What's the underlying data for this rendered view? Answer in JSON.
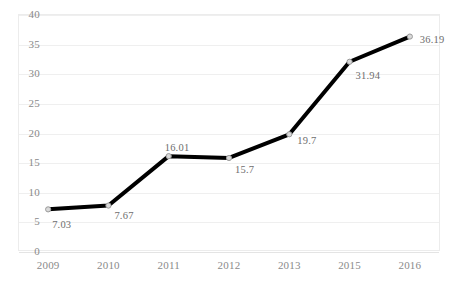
{
  "chart_data": {
    "type": "line",
    "title": "",
    "subtitle": "",
    "xlabel": "",
    "ylabel": "",
    "categories": [
      "2009",
      "2010",
      "2011",
      "2012",
      "2013",
      "2015",
      "2016"
    ],
    "values": [
      7.03,
      7.67,
      16.01,
      15.7,
      19.7,
      31.94,
      36.19
    ],
    "data_labels": [
      "7.03",
      "7.67",
      "16.01",
      "15.7",
      "19.7",
      "31.94",
      "36.19"
    ],
    "series": [
      {
        "name": "",
        "values": [
          7.03,
          7.67,
          16.01,
          15.7,
          19.7,
          31.94,
          36.19
        ]
      }
    ],
    "ylim": [
      0,
      40
    ],
    "yticks": [
      0,
      5,
      10,
      15,
      20,
      25,
      30,
      35,
      40
    ],
    "ytick_labels": [
      "0",
      "5",
      "10",
      "15",
      "20",
      "25",
      "30",
      "35",
      "40"
    ],
    "grid": true,
    "grid_axis": "y",
    "legend": false,
    "legend_position": "none",
    "line_color": "#000000",
    "line_width": 4,
    "marker": "circle",
    "marker_color": "#d9d9d9",
    "marker_edge_color": "#9b9b9b",
    "grid_color": "#efefef",
    "axis_color": "#ececec",
    "tick_label_color": "#8a8a8a",
    "data_label_color": "#6e6e6e",
    "background_color": "#ffffff",
    "label_offsets": [
      {
        "dx": 4,
        "dy": 10
      },
      {
        "dx": 6,
        "dy": 4
      },
      {
        "dx": -4,
        "dy": -14
      },
      {
        "dx": 6,
        "dy": 6
      },
      {
        "dx": 8,
        "dy": 1
      },
      {
        "dx": 6,
        "dy": 8
      },
      {
        "dx": 10,
        "dy": -3
      }
    ]
  }
}
